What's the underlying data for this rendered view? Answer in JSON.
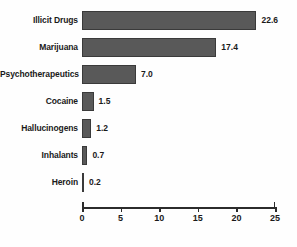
{
  "chart_data": {
    "type": "bar",
    "orientation": "horizontal",
    "title": "",
    "xlabel": "",
    "ylabel": "",
    "categories": [
      "Illicit Drugs",
      "Marijuana",
      "Psychotherapeutics",
      "Cocaine",
      "Hallucinogens",
      "Inhalants",
      "Heroin"
    ],
    "values": [
      22.6,
      17.4,
      7.0,
      1.5,
      1.2,
      0.7,
      0.2
    ],
    "value_labels": [
      "22.6",
      "17.4",
      "7.0",
      "1.5",
      "1.2",
      "0.7",
      "0.2"
    ],
    "xlim": [
      0,
      25
    ],
    "xticks": [
      0,
      5,
      10,
      15,
      20,
      25
    ],
    "xtick_labels": [
      "0",
      "5",
      "10",
      "15",
      "20",
      "25"
    ],
    "grid": false,
    "legend": false,
    "bar_color": "#595959",
    "bar_border_color": "#3a3a3a",
    "axis_color": "#2b2b2b",
    "text_color": "#1a1a1a",
    "background_color": "#ffffff"
  }
}
